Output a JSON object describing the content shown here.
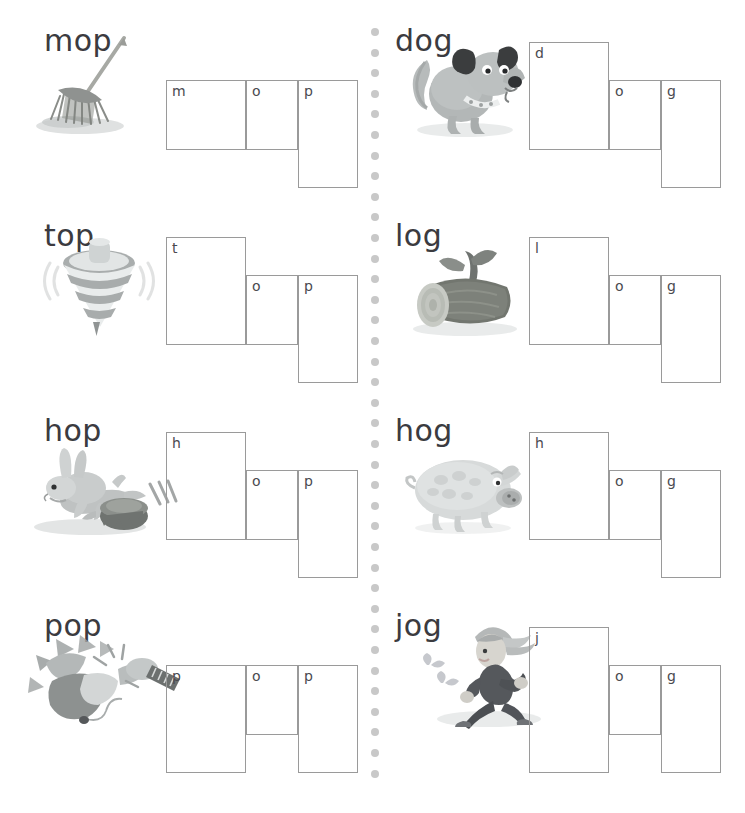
{
  "worksheet": {
    "background": "#ffffff",
    "box_border_color": "#9a9a9a",
    "word_color": "#3b3b40",
    "letter_color": "#4a4a50",
    "divider_dot_color": "#c8c8c8",
    "divider_dot_count": 37
  },
  "columns": [
    {
      "name": "left-column",
      "rime": "op",
      "items": [
        {
          "word": "mop",
          "picture": "mop-illustration",
          "letters": [
            {
              "char": "m",
              "band": "x"
            },
            {
              "char": "o",
              "band": "x"
            },
            {
              "char": "p",
              "band": "descender"
            }
          ]
        },
        {
          "word": "top",
          "picture": "spinning-top-illustration",
          "letters": [
            {
              "char": "t",
              "band": "ascender"
            },
            {
              "char": "o",
              "band": "x"
            },
            {
              "char": "p",
              "band": "descender"
            }
          ]
        },
        {
          "word": "hop",
          "picture": "hopping-rabbit-illustration",
          "letters": [
            {
              "char": "h",
              "band": "ascender"
            },
            {
              "char": "o",
              "band": "x"
            },
            {
              "char": "p",
              "band": "descender"
            }
          ]
        },
        {
          "word": "pop",
          "picture": "popping-balloon-illustration",
          "letters": [
            {
              "char": "p",
              "band": "descender"
            },
            {
              "char": "o",
              "band": "x"
            },
            {
              "char": "p",
              "band": "descender"
            }
          ]
        }
      ]
    },
    {
      "name": "right-column",
      "rime": "og",
      "items": [
        {
          "word": "dog",
          "picture": "dog-illustration",
          "letters": [
            {
              "char": "d",
              "band": "ascender"
            },
            {
              "char": "o",
              "band": "x"
            },
            {
              "char": "g",
              "band": "descender"
            }
          ]
        },
        {
          "word": "log",
          "picture": "log-illustration",
          "letters": [
            {
              "char": "l",
              "band": "ascender"
            },
            {
              "char": "o",
              "band": "x"
            },
            {
              "char": "g",
              "band": "descender"
            }
          ]
        },
        {
          "word": "hog",
          "picture": "hog-illustration",
          "letters": [
            {
              "char": "h",
              "band": "ascender"
            },
            {
              "char": "o",
              "band": "x"
            },
            {
              "char": "g",
              "band": "descender"
            }
          ]
        },
        {
          "word": "jog",
          "picture": "jogger-illustration",
          "letters": [
            {
              "char": "j",
              "band": "full"
            },
            {
              "char": "o",
              "band": "x"
            },
            {
              "char": "g",
              "band": "descender"
            }
          ]
        }
      ]
    }
  ]
}
